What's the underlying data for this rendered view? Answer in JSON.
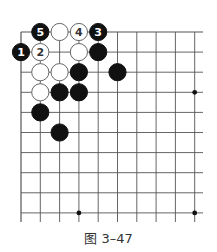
{
  "figure": {
    "caption": "图 3–47",
    "board": {
      "origin_x": 21,
      "origin_y": 32,
      "col_spacing": 19.3,
      "row_spacing": 20.1,
      "cols": 10,
      "rows": 10,
      "extend_right": 203,
      "extend_bottom": 222,
      "line_color": "#555555",
      "star_points": [
        [
          3,
          9
        ],
        [
          9,
          3
        ],
        [
          9,
          9
        ]
      ],
      "stones": [
        {
          "col": 1,
          "row": 0,
          "color": "black",
          "label": "5"
        },
        {
          "col": 2,
          "row": 0,
          "color": "white",
          "label": ""
        },
        {
          "col": 3,
          "row": 0,
          "color": "white",
          "label": "4"
        },
        {
          "col": 4,
          "row": 0,
          "color": "black",
          "label": "3"
        },
        {
          "col": 0,
          "row": 1,
          "color": "black",
          "label": "1"
        },
        {
          "col": 1,
          "row": 1,
          "color": "white",
          "label": "2"
        },
        {
          "col": 3,
          "row": 1,
          "color": "white",
          "label": ""
        },
        {
          "col": 4,
          "row": 1,
          "color": "black",
          "label": ""
        },
        {
          "col": 1,
          "row": 2,
          "color": "white",
          "label": ""
        },
        {
          "col": 2,
          "row": 2,
          "color": "white",
          "label": ""
        },
        {
          "col": 3,
          "row": 2,
          "color": "black",
          "label": ""
        },
        {
          "col": 5,
          "row": 2,
          "color": "black",
          "label": ""
        },
        {
          "col": 1,
          "row": 3,
          "color": "white",
          "label": ""
        },
        {
          "col": 2,
          "row": 3,
          "color": "black",
          "label": ""
        },
        {
          "col": 3,
          "row": 3,
          "color": "black",
          "label": ""
        },
        {
          "col": 1,
          "row": 4,
          "color": "black",
          "label": ""
        },
        {
          "col": 2,
          "row": 5,
          "color": "black",
          "label": ""
        }
      ]
    }
  }
}
